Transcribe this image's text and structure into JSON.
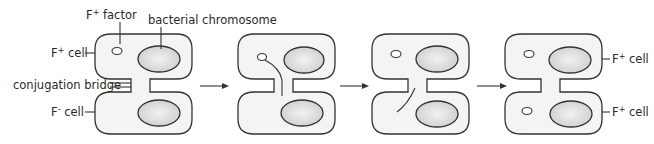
{
  "labels": {
    "f_factor": "F",
    "f_factor_sup": "+",
    "f_factor_suffix": " factor",
    "bacterial_chromosome": "bacterial chromosome",
    "f_plus_cell": "F",
    "f_plus_sup": "+",
    "f_plus_suffix": " cell",
    "conjugation_bridge": "conjugation bridge",
    "f_minus_cell": "F",
    "f_minus_sup": "-",
    "f_minus_suffix": " cell",
    "result_top_cell": "F",
    "result_top_sup": "+",
    "result_top_suffix": " cell",
    "result_bottom_cell": "F",
    "result_bottom_sup": "+",
    "result_bottom_suffix": " cell"
  },
  "stages": [
    {
      "name": "stage-1",
      "description": "F+ cell with F factor joined to F- cell by conjugation bridge"
    },
    {
      "name": "stage-2",
      "description": "F factor strand passing through bridge"
    },
    {
      "name": "stage-3",
      "description": "Single strand transferred into recipient cell"
    },
    {
      "name": "stage-4",
      "description": "Both cells now F+ with F factor"
    }
  ],
  "colors": {
    "cell_fill": "#f4f4f4",
    "chromosome_fill": "#d9d9d9",
    "outline": "#333333"
  }
}
